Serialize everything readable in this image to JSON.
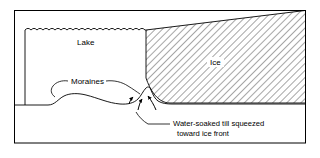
{
  "figure": {
    "type": "cross-section-diagram",
    "title_visible": false,
    "background_color": "#ffffff",
    "line_color": "#000000",
    "frame": {
      "visible": true,
      "left": 14,
      "top": 10,
      "right": 306,
      "bottom": 143,
      "stroke_color": "#000000"
    }
  },
  "labels": {
    "lake": "Lake",
    "ice": "Ice",
    "moraines": "Moraines",
    "till_line1": "Water-soaked till squeezed",
    "till_line2": "toward ice front"
  },
  "regions": [
    {
      "name": "lake",
      "label": "Lake",
      "fill": "none",
      "description": "open water body left of the ice front, bounded above by a wavy water-surface line"
    },
    {
      "name": "ice",
      "label": "Ice",
      "fill": "diagonal-hatch",
      "hatch_color": "#000000",
      "description": "hatched wedge of glacier ice occupying the right side, top surface sloping up to the right"
    },
    {
      "name": "substrate",
      "label": "",
      "fill": "none",
      "description": "ground / till below the lake floor and ice base"
    }
  ],
  "annotations": [
    {
      "name": "moraines",
      "text": "Moraines",
      "leader_count": 2,
      "points_to": [
        "low broad moraine ridge at left",
        "sharp moraine ridge at ice front"
      ]
    },
    {
      "name": "water-soaked-till",
      "text": "Water-soaked till squeezed toward ice front",
      "leader_count": 1,
      "points_to": [
        "till beneath the ice margin"
      ]
    }
  ],
  "arrows": [
    {
      "name": "till-flow-arrow-left",
      "direction": "up-right",
      "meaning": "till squeezed toward ice front"
    },
    {
      "name": "till-flow-arrow-mid",
      "direction": "up-right",
      "meaning": "till squeezed toward ice front"
    },
    {
      "name": "till-flow-arrow-right",
      "direction": "up-left",
      "meaning": "till squeezed toward ice front"
    }
  ],
  "water_surface": {
    "name": "lake-surface",
    "style": "scalloped-wavy-line",
    "wave_count": 20,
    "y": 30
  }
}
